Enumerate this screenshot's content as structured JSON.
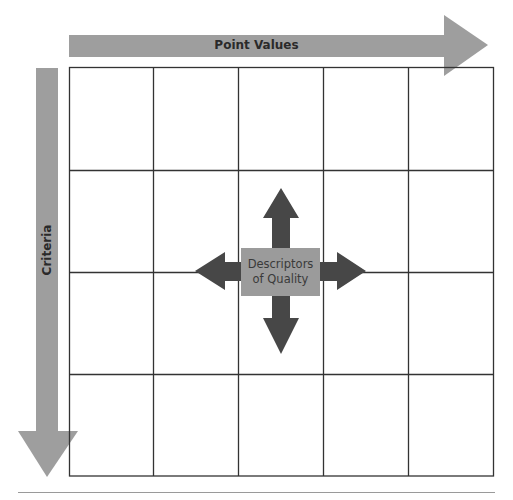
{
  "diagram": {
    "top_arrow": {
      "label": "Point Values",
      "direction": "right",
      "color": "#9e9e9e"
    },
    "left_arrow": {
      "label": "Criteria",
      "direction": "down",
      "color": "#9e9e9e"
    },
    "center": {
      "line1": "Descriptors",
      "line2": "of Quality",
      "box_color": "#9b9b9b",
      "arrows_color": "#474747",
      "arrow_directions": [
        "up",
        "down",
        "left",
        "right"
      ]
    },
    "grid": {
      "rows": 4,
      "columns": 5,
      "line_color": "#333333"
    }
  }
}
